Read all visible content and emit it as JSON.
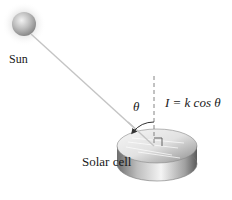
{
  "diagram": {
    "labels": {
      "sun": "Sun",
      "solar_cell": "Solar cell",
      "angle": "θ",
      "formula": "I = k cos θ"
    },
    "icons": {
      "sun": "sun-sphere-icon",
      "solar_cell": "solar-cell-disc-icon",
      "angle_arrow": "curved-arrow-icon",
      "right_angle": "right-angle-marker-icon"
    },
    "colors": {
      "background": "#ffffff",
      "sun_fill": "#b8b8b8",
      "sun_halo": "#eeeeee",
      "ray": "#c8c8c8",
      "normal_line": "#888888",
      "disc_top": "#e6e6e6",
      "disc_side": "#9a9a9a",
      "text": "#1a1a1a"
    }
  }
}
